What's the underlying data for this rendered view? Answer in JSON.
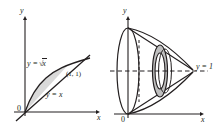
{
  "figure": {
    "type": "math-diagram",
    "colors": {
      "stroke": "#231f20",
      "shade_fill": "#d9d9d9",
      "washer_fill": "#bfbfbf",
      "background": "#ffffff"
    }
  },
  "left_panel": {
    "name": "region-plot",
    "axes": {
      "y_label": "y",
      "x_label": "x",
      "origin_label": "0"
    },
    "curves": [
      {
        "id": "sqrt-curve",
        "label_text": "y =",
        "label_radicand": "x",
        "equation": "y = √x"
      },
      {
        "id": "line-curve",
        "label": "y = x",
        "equation": "y = x"
      }
    ],
    "points": [
      {
        "id": "intersection",
        "label": "(1, 1)",
        "x": 1,
        "y": 1
      }
    ],
    "shaded_region": {
      "label": "region between y = √x and y = x on [0,1]"
    }
  },
  "right_panel": {
    "name": "solid-of-revolution-plot",
    "axes": {
      "y_label": "y",
      "x_label": "x",
      "origin_label": "0"
    },
    "axis_of_revolution": {
      "label": "y = 1",
      "style": "dashed-horizontal"
    },
    "elements": [
      {
        "id": "outer-surface",
        "label": "surface from y = √x revolved about y = 1"
      },
      {
        "id": "inner-surface",
        "label": "surface from y = x revolved about y = 1"
      },
      {
        "id": "washer-cross-section",
        "label": "representative washer"
      },
      {
        "id": "hidden-edge",
        "label": "hidden vertical edge",
        "style": "dashed"
      }
    ]
  }
}
